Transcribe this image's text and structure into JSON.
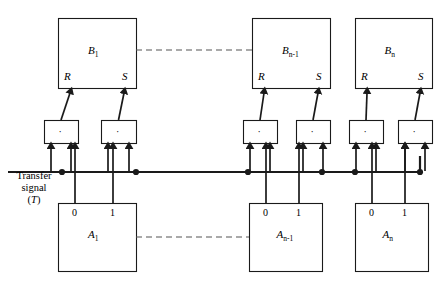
{
  "diagram": {
    "background": "#ffffff",
    "ink": "#1a1a1a",
    "dash_color": "#555555",
    "transfer_label": {
      "line1": "Transfer",
      "line2": "signal",
      "line3_open": "(",
      "line3_sym": "T",
      "line3_close": ")"
    },
    "gate_symbol": "·",
    "ellipsis_label": "— — —",
    "b_boxes": [
      {
        "id": "b1",
        "name": "B",
        "sub": "1",
        "x": 58,
        "y": 18,
        "w": 78,
        "h": 70,
        "r": "R",
        "s": "S"
      },
      {
        "id": "bn1",
        "name": "B",
        "sub": "n-1",
        "x": 252,
        "y": 18,
        "w": 78,
        "h": 70,
        "r": "R",
        "s": "S"
      },
      {
        "id": "bn",
        "name": "B",
        "sub": "n",
        "x": 355,
        "y": 18,
        "w": 77,
        "h": 70,
        "r": "R",
        "s": "S"
      }
    ],
    "a_boxes": [
      {
        "id": "a1",
        "name": "A",
        "sub": "1",
        "x": 58,
        "y": 203,
        "w": 78,
        "h": 68,
        "zero": "0",
        "one": "1"
      },
      {
        "id": "an1",
        "name": "A",
        "sub": "n-1",
        "x": 249,
        "y": 203,
        "w": 73,
        "h": 68,
        "zero": "0",
        "one": "1"
      },
      {
        "id": "an",
        "name": "A",
        "sub": "n",
        "x": 355,
        "y": 203,
        "w": 73,
        "h": 68,
        "zero": "0",
        "one": "1"
      }
    ],
    "and_gates": [
      {
        "id": "g1",
        "x": 44,
        "y": 120,
        "w": 34,
        "h": 23,
        "stage": "1",
        "input": "R"
      },
      {
        "id": "g2",
        "x": 101,
        "y": 120,
        "w": 35,
        "h": 23,
        "stage": "1",
        "input": "S"
      },
      {
        "id": "g3",
        "x": 243,
        "y": 120,
        "w": 34,
        "h": 23,
        "stage": "n-1",
        "input": "R"
      },
      {
        "id": "g4",
        "x": 296,
        "y": 120,
        "w": 34,
        "h": 23,
        "stage": "n-1",
        "input": "S"
      },
      {
        "id": "g5",
        "x": 349,
        "y": 120,
        "w": 34,
        "h": 23,
        "stage": "n",
        "input": "R"
      },
      {
        "id": "g6",
        "x": 398,
        "y": 120,
        "w": 34,
        "h": 23,
        "stage": "n",
        "input": "S"
      }
    ],
    "bus": {
      "y": 172,
      "x_start": 8,
      "x_end": 420,
      "label": "transfer-signal-bus"
    },
    "bus_junctions": [
      62,
      136,
      248,
      322,
      355,
      420
    ],
    "dashed_links": [
      {
        "id": "b-dash",
        "x1": 136,
        "x2": 252,
        "y": 50
      },
      {
        "id": "a-dash",
        "x1": 136,
        "x2": 249,
        "y": 237
      }
    ]
  }
}
